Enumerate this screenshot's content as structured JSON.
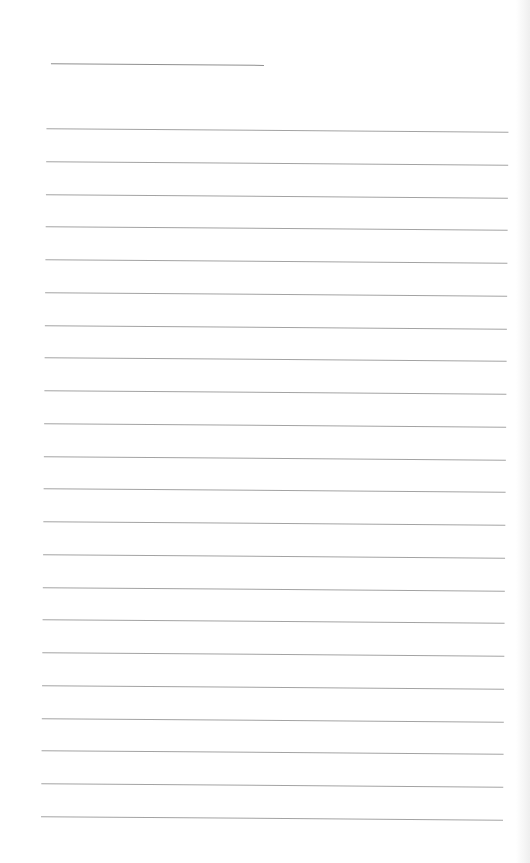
{
  "document": {
    "type": "lined-paper",
    "background_color": "#ffffff",
    "line_color": "#a3a3a3",
    "title_line": {
      "x": 48,
      "y": 65,
      "width": 213,
      "text": ""
    },
    "rules": {
      "count": 22,
      "x": 44,
      "first_y": 130,
      "spacing": 32.76,
      "width": 462
    },
    "lines": [
      "",
      "",
      "",
      "",
      "",
      "",
      "",
      "",
      "",
      "",
      "",
      "",
      "",
      "",
      "",
      "",
      "",
      "",
      "",
      "",
      "",
      ""
    ]
  }
}
